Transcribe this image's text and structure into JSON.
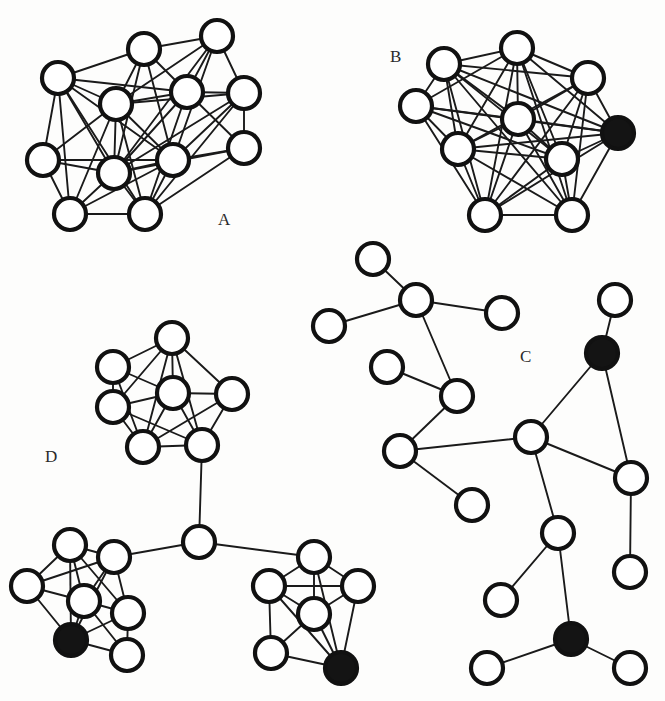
{
  "figure": {
    "background_color": "#fdfdfc",
    "node_outline_color": "#111111",
    "node_open_fill": "#ffffff",
    "node_filled_fill": "#141414",
    "edge_color": "#1a1a1a",
    "node_radius": 16,
    "width": 665,
    "height": 701
  },
  "labels": {
    "a": "A",
    "b": "B",
    "c": "C",
    "d": "D"
  },
  "label_positions": {
    "a": {
      "x": 218,
      "y": 225
    },
    "b": {
      "x": 390,
      "y": 62
    },
    "c": {
      "x": 520,
      "y": 362
    },
    "d": {
      "x": 45,
      "y": 462
    }
  },
  "chart_data": {
    "type": "diagram",
    "subtype": "node-link-graph",
    "panels": [
      {
        "id": "A",
        "label": "A",
        "description": "Dense single cluster, all nodes open",
        "node_count": 12,
        "filled_node_count": 0,
        "nodes": [
          {
            "id": "a0",
            "x": 217,
            "y": 36,
            "filled": false
          },
          {
            "id": "a1",
            "x": 144,
            "y": 49,
            "filled": false
          },
          {
            "id": "a2",
            "x": 58,
            "y": 78,
            "filled": false
          },
          {
            "id": "a3",
            "x": 187,
            "y": 92,
            "filled": false
          },
          {
            "id": "a4",
            "x": 244,
            "y": 93,
            "filled": false
          },
          {
            "id": "a5",
            "x": 116,
            "y": 104,
            "filled": false
          },
          {
            "id": "a6",
            "x": 244,
            "y": 148,
            "filled": false
          },
          {
            "id": "a7",
            "x": 43,
            "y": 160,
            "filled": false
          },
          {
            "id": "a8",
            "x": 173,
            "y": 160,
            "filled": false
          },
          {
            "id": "a9",
            "x": 114,
            "y": 173,
            "filled": false
          },
          {
            "id": "a10",
            "x": 70,
            "y": 214,
            "filled": false
          },
          {
            "id": "a11",
            "x": 145,
            "y": 214,
            "filled": false
          }
        ],
        "edges": [
          [
            "a0",
            "a1"
          ],
          [
            "a0",
            "a3"
          ],
          [
            "a0",
            "a4"
          ],
          [
            "a0",
            "a5"
          ],
          [
            "a0",
            "a8"
          ],
          [
            "a0",
            "a9"
          ],
          [
            "a1",
            "a2"
          ],
          [
            "a1",
            "a3"
          ],
          [
            "a1",
            "a5"
          ],
          [
            "a1",
            "a8"
          ],
          [
            "a1",
            "a9"
          ],
          [
            "a2",
            "a5"
          ],
          [
            "a2",
            "a7"
          ],
          [
            "a2",
            "a9"
          ],
          [
            "a2",
            "a8"
          ],
          [
            "a2",
            "a10"
          ],
          [
            "a2",
            "a11"
          ],
          [
            "a2",
            "a3"
          ],
          [
            "a3",
            "a4"
          ],
          [
            "a3",
            "a5"
          ],
          [
            "a3",
            "a9"
          ],
          [
            "a3",
            "a11"
          ],
          [
            "a3",
            "a6"
          ],
          [
            "a4",
            "a5"
          ],
          [
            "a4",
            "a6"
          ],
          [
            "a4",
            "a8"
          ],
          [
            "a4",
            "a9"
          ],
          [
            "a4",
            "a11"
          ],
          [
            "a5",
            "a8"
          ],
          [
            "a5",
            "a9"
          ],
          [
            "a5",
            "a10"
          ],
          [
            "a5",
            "a11"
          ],
          [
            "a5",
            "a7"
          ],
          [
            "a6",
            "a8"
          ],
          [
            "a6",
            "a11"
          ],
          [
            "a6",
            "a9"
          ],
          [
            "a7",
            "a9"
          ],
          [
            "a7",
            "a10"
          ],
          [
            "a7",
            "a8"
          ],
          [
            "a8",
            "a9"
          ],
          [
            "a8",
            "a11"
          ],
          [
            "a8",
            "a10"
          ],
          [
            "a9",
            "a10"
          ],
          [
            "a9",
            "a11"
          ],
          [
            "a10",
            "a11"
          ]
        ]
      },
      {
        "id": "B",
        "label": "B",
        "description": "Dense single cluster with one filled (black) node at the right",
        "node_count": 10,
        "filled_node_count": 1,
        "nodes": [
          {
            "id": "b0",
            "x": 517,
            "y": 48,
            "filled": false
          },
          {
            "id": "b1",
            "x": 444,
            "y": 64,
            "filled": false
          },
          {
            "id": "b2",
            "x": 588,
            "y": 78,
            "filled": false
          },
          {
            "id": "b3",
            "x": 416,
            "y": 106,
            "filled": false
          },
          {
            "id": "b4",
            "x": 518,
            "y": 119,
            "filled": false
          },
          {
            "id": "b5",
            "x": 618,
            "y": 133,
            "filled": true
          },
          {
            "id": "b6",
            "x": 458,
            "y": 149,
            "filled": false
          },
          {
            "id": "b7",
            "x": 562,
            "y": 159,
            "filled": false
          },
          {
            "id": "b8",
            "x": 485,
            "y": 215,
            "filled": false
          },
          {
            "id": "b9",
            "x": 572,
            "y": 215,
            "filled": false
          }
        ],
        "edges": [
          [
            "b0",
            "b1"
          ],
          [
            "b0",
            "b2"
          ],
          [
            "b0",
            "b3"
          ],
          [
            "b0",
            "b4"
          ],
          [
            "b0",
            "b5"
          ],
          [
            "b0",
            "b6"
          ],
          [
            "b0",
            "b7"
          ],
          [
            "b0",
            "b8"
          ],
          [
            "b0",
            "b9"
          ],
          [
            "b1",
            "b2"
          ],
          [
            "b1",
            "b3"
          ],
          [
            "b1",
            "b4"
          ],
          [
            "b1",
            "b5"
          ],
          [
            "b1",
            "b6"
          ],
          [
            "b1",
            "b7"
          ],
          [
            "b1",
            "b8"
          ],
          [
            "b1",
            "b9"
          ],
          [
            "b2",
            "b4"
          ],
          [
            "b2",
            "b5"
          ],
          [
            "b2",
            "b6"
          ],
          [
            "b2",
            "b7"
          ],
          [
            "b2",
            "b8"
          ],
          [
            "b2",
            "b9"
          ],
          [
            "b3",
            "b4"
          ],
          [
            "b3",
            "b6"
          ],
          [
            "b3",
            "b7"
          ],
          [
            "b3",
            "b8"
          ],
          [
            "b3",
            "b5"
          ],
          [
            "b4",
            "b5"
          ],
          [
            "b4",
            "b6"
          ],
          [
            "b4",
            "b7"
          ],
          [
            "b4",
            "b8"
          ],
          [
            "b4",
            "b9"
          ],
          [
            "b5",
            "b7"
          ],
          [
            "b5",
            "b8"
          ],
          [
            "b5",
            "b9"
          ],
          [
            "b5",
            "b6"
          ],
          [
            "b6",
            "b7"
          ],
          [
            "b6",
            "b8"
          ],
          [
            "b6",
            "b9"
          ],
          [
            "b7",
            "b8"
          ],
          [
            "b7",
            "b9"
          ],
          [
            "b8",
            "b9"
          ]
        ]
      },
      {
        "id": "C",
        "label": "C",
        "description": "Sparse tree-like scale-free network with two filled (black) nodes",
        "node_count": 17,
        "filled_node_count": 2,
        "nodes": [
          {
            "id": "c0",
            "x": 373,
            "y": 259,
            "filled": false
          },
          {
            "id": "c1",
            "x": 416,
            "y": 300,
            "filled": false
          },
          {
            "id": "c2",
            "x": 329,
            "y": 326,
            "filled": false
          },
          {
            "id": "c3",
            "x": 502,
            "y": 313,
            "filled": false
          },
          {
            "id": "c4",
            "x": 387,
            "y": 367,
            "filled": false
          },
          {
            "id": "c5",
            "x": 457,
            "y": 396,
            "filled": false
          },
          {
            "id": "c6",
            "x": 400,
            "y": 451,
            "filled": false
          },
          {
            "id": "c7",
            "x": 472,
            "y": 505,
            "filled": false
          },
          {
            "id": "c8",
            "x": 615,
            "y": 300,
            "filled": false
          },
          {
            "id": "c9",
            "x": 602,
            "y": 353,
            "filled": true
          },
          {
            "id": "c10",
            "x": 531,
            "y": 437,
            "filled": false
          },
          {
            "id": "c11",
            "x": 631,
            "y": 478,
            "filled": false
          },
          {
            "id": "c12",
            "x": 630,
            "y": 572,
            "filled": false
          },
          {
            "id": "c13",
            "x": 558,
            "y": 533,
            "filled": false
          },
          {
            "id": "c14",
            "x": 501,
            "y": 600,
            "filled": false
          },
          {
            "id": "c15",
            "x": 571,
            "y": 639,
            "filled": true
          },
          {
            "id": "c16",
            "x": 487,
            "y": 668,
            "filled": false
          },
          {
            "id": "c17",
            "x": 630,
            "y": 668,
            "filled": false
          }
        ],
        "edges": [
          [
            "c0",
            "c1"
          ],
          [
            "c1",
            "c2"
          ],
          [
            "c1",
            "c3"
          ],
          [
            "c1",
            "c5"
          ],
          [
            "c4",
            "c5"
          ],
          [
            "c5",
            "c6"
          ],
          [
            "c6",
            "c7"
          ],
          [
            "c6",
            "c10"
          ],
          [
            "c8",
            "c9"
          ],
          [
            "c9",
            "c10"
          ],
          [
            "c9",
            "c11"
          ],
          [
            "c10",
            "c11"
          ],
          [
            "c10",
            "c13"
          ],
          [
            "c11",
            "c12"
          ],
          [
            "c13",
            "c14"
          ],
          [
            "c13",
            "c15"
          ],
          [
            "c15",
            "c16"
          ],
          [
            "c15",
            "c17"
          ]
        ]
      },
      {
        "id": "D",
        "label": "D",
        "description": "Three dense clusters joined through a single central hub node; two clusters contain a filled (black) node",
        "node_count": 21,
        "filled_node_count": 2,
        "cluster_count": 3,
        "nodes": [
          {
            "id": "d0",
            "x": 172,
            "y": 338,
            "filled": false
          },
          {
            "id": "d1",
            "x": 113,
            "y": 367,
            "filled": false
          },
          {
            "id": "d2",
            "x": 113,
            "y": 407,
            "filled": false
          },
          {
            "id": "d3",
            "x": 173,
            "y": 393,
            "filled": false
          },
          {
            "id": "d4",
            "x": 232,
            "y": 394,
            "filled": false
          },
          {
            "id": "d5",
            "x": 143,
            "y": 447,
            "filled": false
          },
          {
            "id": "d6",
            "x": 202,
            "y": 445,
            "filled": false
          },
          {
            "id": "dh",
            "x": 199,
            "y": 542,
            "filled": false
          },
          {
            "id": "e0",
            "x": 70,
            "y": 545,
            "filled": false
          },
          {
            "id": "e1",
            "x": 114,
            "y": 557,
            "filled": false
          },
          {
            "id": "e2",
            "x": 27,
            "y": 586,
            "filled": false
          },
          {
            "id": "e3",
            "x": 84,
            "y": 601,
            "filled": false
          },
          {
            "id": "e4",
            "x": 128,
            "y": 613,
            "filled": false
          },
          {
            "id": "e5",
            "x": 71,
            "y": 640,
            "filled": true
          },
          {
            "id": "e6",
            "x": 127,
            "y": 655,
            "filled": false
          },
          {
            "id": "f0",
            "x": 314,
            "y": 557,
            "filled": false
          },
          {
            "id": "f1",
            "x": 269,
            "y": 586,
            "filled": false
          },
          {
            "id": "f2",
            "x": 358,
            "y": 586,
            "filled": false
          },
          {
            "id": "f3",
            "x": 314,
            "y": 614,
            "filled": false
          },
          {
            "id": "f4",
            "x": 271,
            "y": 653,
            "filled": false
          },
          {
            "id": "f5",
            "x": 341,
            "y": 668,
            "filled": true
          }
        ],
        "edges": [
          [
            "d0",
            "d1"
          ],
          [
            "d0",
            "d3"
          ],
          [
            "d0",
            "d4"
          ],
          [
            "d0",
            "d5"
          ],
          [
            "d0",
            "d6"
          ],
          [
            "d0",
            "d2"
          ],
          [
            "d1",
            "d2"
          ],
          [
            "d1",
            "d3"
          ],
          [
            "d1",
            "d5"
          ],
          [
            "d2",
            "d3"
          ],
          [
            "d2",
            "d5"
          ],
          [
            "d2",
            "d6"
          ],
          [
            "d3",
            "d4"
          ],
          [
            "d3",
            "d5"
          ],
          [
            "d3",
            "d6"
          ],
          [
            "d4",
            "d6"
          ],
          [
            "d4",
            "d5"
          ],
          [
            "d5",
            "d6"
          ],
          [
            "d6",
            "dh"
          ],
          [
            "dh",
            "e1"
          ],
          [
            "dh",
            "f0"
          ],
          [
            "e0",
            "e1"
          ],
          [
            "e0",
            "e2"
          ],
          [
            "e0",
            "e3"
          ],
          [
            "e0",
            "e5"
          ],
          [
            "e0",
            "e4"
          ],
          [
            "e1",
            "e3"
          ],
          [
            "e1",
            "e4"
          ],
          [
            "e1",
            "e5"
          ],
          [
            "e2",
            "e3"
          ],
          [
            "e2",
            "e5"
          ],
          [
            "e2",
            "e1"
          ],
          [
            "e3",
            "e4"
          ],
          [
            "e3",
            "e5"
          ],
          [
            "e3",
            "e6"
          ],
          [
            "e4",
            "e5"
          ],
          [
            "e4",
            "e6"
          ],
          [
            "e5",
            "e6"
          ],
          [
            "f0",
            "f1"
          ],
          [
            "f0",
            "f2"
          ],
          [
            "f0",
            "f3"
          ],
          [
            "f0",
            "f5"
          ],
          [
            "f1",
            "f2"
          ],
          [
            "f1",
            "f3"
          ],
          [
            "f1",
            "f4"
          ],
          [
            "f1",
            "f5"
          ],
          [
            "f2",
            "f3"
          ],
          [
            "f2",
            "f5"
          ],
          [
            "f3",
            "f4"
          ],
          [
            "f3",
            "f5"
          ],
          [
            "f4",
            "f5"
          ]
        ]
      }
    ]
  }
}
